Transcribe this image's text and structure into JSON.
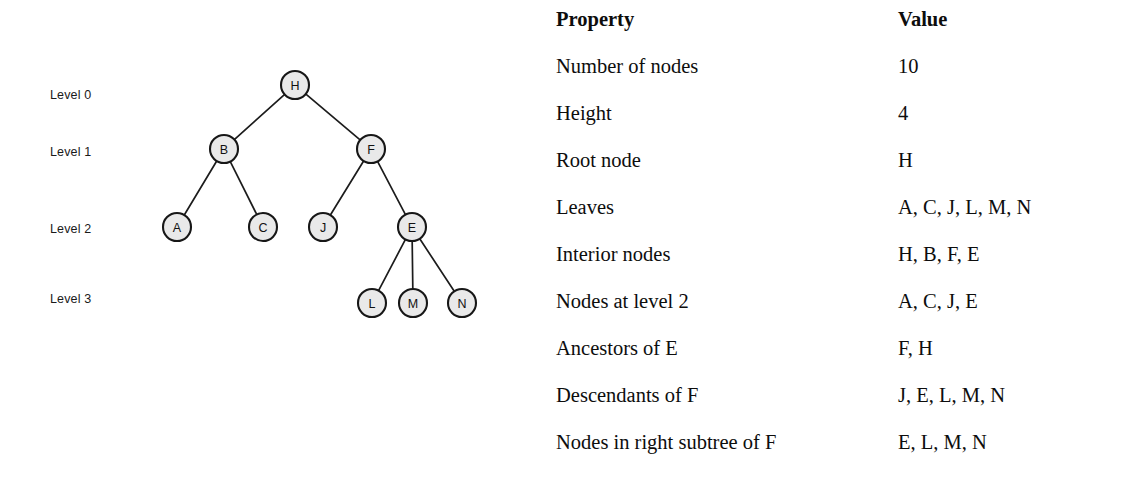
{
  "figure": {
    "level_labels": [
      {
        "text": "Level 0",
        "y": 88
      },
      {
        "text": "Level 1",
        "y": 145
      },
      {
        "text": "Level 2",
        "y": 222
      },
      {
        "text": "Level 3",
        "y": 292
      }
    ],
    "nodes": [
      {
        "id": "H",
        "label": "H",
        "x": 295,
        "y": 85,
        "level": 0
      },
      {
        "id": "B",
        "label": "B",
        "x": 224,
        "y": 149,
        "level": 1
      },
      {
        "id": "F",
        "label": "F",
        "x": 371,
        "y": 149,
        "level": 1
      },
      {
        "id": "A",
        "label": "A",
        "x": 177,
        "y": 227,
        "level": 2
      },
      {
        "id": "C",
        "label": "C",
        "x": 263,
        "y": 227,
        "level": 2
      },
      {
        "id": "J",
        "label": "J",
        "x": 323,
        "y": 227,
        "level": 2
      },
      {
        "id": "E",
        "label": "E",
        "x": 412,
        "y": 227,
        "level": 2
      },
      {
        "id": "L",
        "label": "L",
        "x": 372,
        "y": 303,
        "level": 3
      },
      {
        "id": "M",
        "label": "M",
        "x": 413,
        "y": 303,
        "level": 3
      },
      {
        "id": "N",
        "label": "N",
        "x": 462,
        "y": 303,
        "level": 3
      }
    ],
    "edges": [
      {
        "from": "H",
        "to": "B"
      },
      {
        "from": "H",
        "to": "F"
      },
      {
        "from": "B",
        "to": "A"
      },
      {
        "from": "B",
        "to": "C"
      },
      {
        "from": "F",
        "to": "J"
      },
      {
        "from": "F",
        "to": "E"
      },
      {
        "from": "E",
        "to": "L"
      },
      {
        "from": "E",
        "to": "M"
      },
      {
        "from": "E",
        "to": "N"
      }
    ],
    "node_radius": 14,
    "colors": {
      "node_fill": "#e9e9e9",
      "node_stroke": "#171717",
      "edge_stroke": "#1c1c1c",
      "text": "#111111",
      "background": "#ffffff"
    }
  },
  "table": {
    "headers": {
      "property": "Property",
      "value": "Value"
    },
    "rows": [
      {
        "property": "Number of nodes",
        "value": "10"
      },
      {
        "property": "Height",
        "value": "4"
      },
      {
        "property": "Root node",
        "value": "H"
      },
      {
        "property": "Leaves",
        "value": "A, C, J, L, M, N"
      },
      {
        "property": "Interior nodes",
        "value": "H, B, F, E"
      },
      {
        "property": "Nodes at level 2",
        "value": "A, C, J, E"
      },
      {
        "property": "Ancestors of E",
        "value": "F, H"
      },
      {
        "property": "Descendants of F",
        "value": "J, E, L, M, N"
      },
      {
        "property": "Nodes in right subtree of F",
        "value": "E, L, M, N"
      }
    ]
  }
}
